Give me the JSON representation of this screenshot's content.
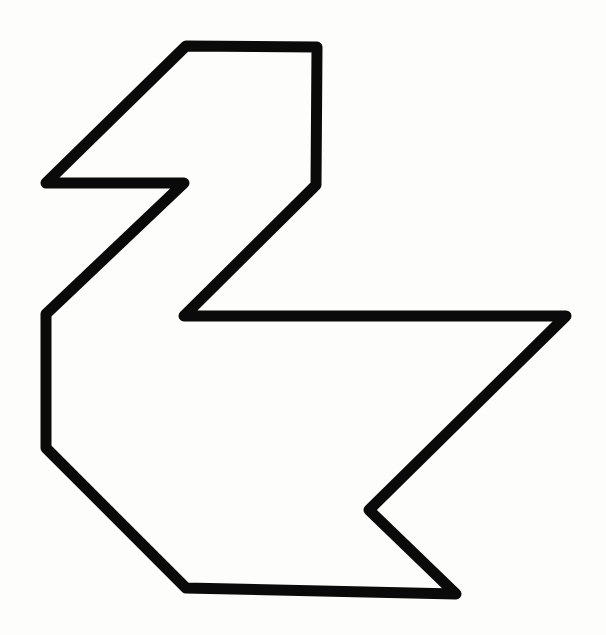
{
  "figure": {
    "background": "#fdfdfb",
    "stroke_color": "#0a0a0a",
    "stroke_width": 11,
    "outline_points": [
      [
        186,
        46
      ],
      [
        317,
        47
      ],
      [
        316,
        185
      ],
      [
        184,
        316
      ],
      [
        566,
        316
      ],
      [
        369,
        510
      ],
      [
        456,
        594
      ],
      [
        186,
        588
      ],
      [
        46,
        448
      ],
      [
        46,
        314
      ],
      [
        184,
        183
      ],
      [
        46,
        183
      ]
    ]
  }
}
